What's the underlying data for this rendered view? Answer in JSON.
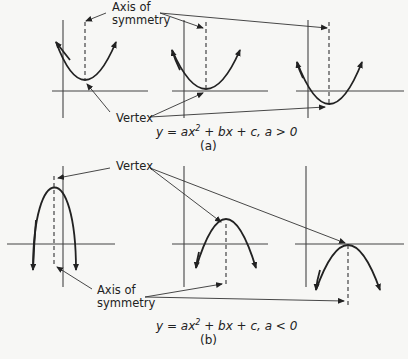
{
  "diagram": {
    "part_a": {
      "axis_label_line1": "Axis of",
      "axis_label_line2": "symmetry",
      "vertex_label": "Vertex",
      "equation_prefix": "y = ax",
      "equation_exp": "2",
      "equation_suffix": " + bx + c, a > 0",
      "caption": "(a)"
    },
    "part_b": {
      "axis_label_line1": "Axis of",
      "axis_label_line2": "symmetry",
      "vertex_label": "Vertex",
      "equation_prefix": "y = ax",
      "equation_exp": "2",
      "equation_suffix": " + bx + c, a < 0",
      "caption": "(b)"
    }
  }
}
